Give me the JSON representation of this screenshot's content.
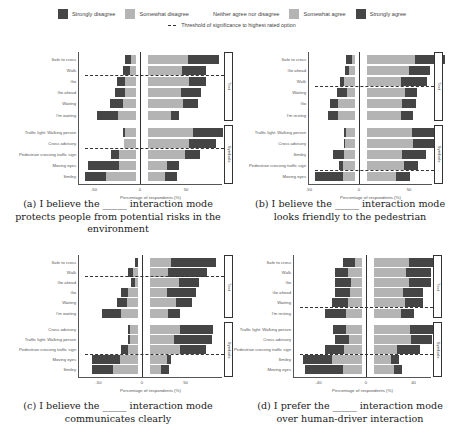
{
  "legend": {
    "items": [
      {
        "label": "Strongly disagree",
        "color": "#454545"
      },
      {
        "label": "Somewhat disagree",
        "color": "#b4b4b4"
      },
      {
        "label": "Neither agree nor disagree",
        "color": "#ffffff"
      },
      {
        "label": "Somewhat agree",
        "color": "#b4b4b4"
      },
      {
        "label": "Strongly agree",
        "color": "#454545"
      }
    ],
    "threshold_label": "Threshold of significance to highest rated option"
  },
  "chart_data": [
    {
      "type": "bar",
      "subtype": "diverging_stacked_likert",
      "caption": "(a) I believe the _____ interaction mode protects people from potential risks in the environment",
      "xlabel": "Percentage of respondents (%)",
      "xticks": [
        -50,
        0,
        50
      ],
      "xlim": [
        -65,
        90
      ],
      "groups": [
        "Text",
        "Symbols"
      ],
      "categories": [
        "Safe to cross",
        "Walk",
        "Go",
        "Go ahead",
        "Waiting",
        "I'm waiting",
        "Traffic light: Walking person",
        "Cross advisory",
        "Pedestrian crossing traffic sign",
        "Moving eyes",
        "Smiley"
      ],
      "category_groups": [
        "Text",
        "Text",
        "Text",
        "Text",
        "Text",
        "Text",
        "Symbols",
        "Symbols",
        "Symbols",
        "Symbols",
        "Symbols"
      ],
      "series": [
        {
          "name": "Strongly disagree",
          "values": [
            7,
            8,
            9,
            11,
            14,
            22,
            2,
            0,
            8,
            33,
            22
          ]
        },
        {
          "name": "Somewhat disagree",
          "values": [
            5,
            6,
            12,
            12,
            14,
            20,
            12,
            13,
            19,
            19,
            33
          ]
        },
        {
          "name": "Somewhat agree",
          "values": [
            44,
            37,
            45,
            36,
            38,
            25,
            49,
            45,
            40,
            21,
            18
          ]
        },
        {
          "name": "Strongly agree",
          "values": [
            33,
            26,
            18,
            22,
            16,
            9,
            32,
            29,
            16,
            13,
            14
          ]
        }
      ],
      "threshold_after_index": [
        1,
        7
      ]
    },
    {
      "type": "bar",
      "subtype": "diverging_stacked_likert",
      "caption": "(b) I believe the _____ interaction mode looks friendly to the pedestrian",
      "xlabel": "Percentage of respondents (%)",
      "xticks": [
        -50,
        0,
        50
      ],
      "xlim": [
        -55,
        95
      ],
      "groups": [
        "Text",
        "Symbols"
      ],
      "categories": [
        "Safe to cross",
        "Go ahead",
        "Walk",
        "Waiting",
        "Go",
        "I'm resting",
        "Traffic light: Walking person",
        "Cross advisory",
        "Smiley",
        "Pedestrian crossing traffic sign",
        "Moving eyes"
      ],
      "category_groups": [
        "Text",
        "Text",
        "Text",
        "Text",
        "Text",
        "Text",
        "Symbols",
        "Symbols",
        "Symbols",
        "Symbols",
        "Symbols"
      ],
      "series": [
        {
          "name": "Strongly disagree",
          "values": [
            6,
            4,
            4,
            10,
            8,
            10,
            2,
            1,
            11,
            4,
            28
          ]
        },
        {
          "name": "Somewhat disagree",
          "values": [
            3,
            6,
            11,
            8,
            17,
            17,
            9,
            10,
            11,
            12,
            12
          ]
        },
        {
          "name": "Somewhat agree",
          "values": [
            48,
            42,
            34,
            38,
            35,
            34,
            45,
            46,
            35,
            37,
            29
          ]
        },
        {
          "name": "Strongly agree",
          "values": [
            30,
            21,
            26,
            12,
            14,
            12,
            24,
            22,
            24,
            14,
            14
          ]
        }
      ],
      "threshold_after_index": [
        2,
        9
      ]
    },
    {
      "type": "bar",
      "subtype": "diverging_stacked_likert",
      "caption": "(c) I believe the _____ interaction mode communicates clearly",
      "xlabel": "Percentage of respondents (%)",
      "xticks": [
        -50,
        0,
        50
      ],
      "xlim": [
        -65,
        90
      ],
      "groups": [
        "Text",
        "Symbols"
      ],
      "categories": [
        "Safe to cross",
        "Walk",
        "Go ahead",
        "Go",
        "Waiting",
        "I'm waiting",
        "Cross advisory",
        "Traffic light: Walking person",
        "Pedestrian crossing traffic sign",
        "Moving eyes",
        "Smiley"
      ],
      "category_groups": [
        "Text",
        "Text",
        "Text",
        "Text",
        "Text",
        "Text",
        "Symbols",
        "Symbols",
        "Symbols",
        "Symbols",
        "Symbols"
      ],
      "series": [
        {
          "name": "Strongly disagree",
          "values": [
            3,
            5,
            5,
            8,
            11,
            21,
            2,
            3,
            7,
            32,
            24
          ]
        },
        {
          "name": "Somewhat disagree",
          "values": [
            0,
            6,
            3,
            12,
            13,
            20,
            9,
            9,
            12,
            21,
            29
          ]
        },
        {
          "name": "Somewhat agree",
          "values": [
            24,
            21,
            33,
            19,
            30,
            21,
            35,
            28,
            34,
            19,
            13
          ]
        },
        {
          "name": "Strongly agree",
          "values": [
            52,
            44,
            23,
            34,
            18,
            14,
            37,
            43,
            30,
            5,
            9
          ]
        }
      ],
      "threshold_after_index": [
        1,
        8
      ]
    },
    {
      "type": "bar",
      "subtype": "diverging_stacked_likert",
      "caption": "(d) I prefer the _____ interaction mode over human-driver interaction",
      "xlabel": "Percentage of respondents (%)",
      "xticks": [
        -40,
        0,
        40
      ],
      "xlim": [
        -75,
        75
      ],
      "groups": [
        "Text",
        "Symbols"
      ],
      "categories": [
        "Safe to cross",
        "Walk",
        "Go",
        "Go ahead",
        "Waiting",
        "I'm resting",
        "Traffic light: Walking person",
        "Cross advisory",
        "Pedestrian crossing traffic sign",
        "Smiley",
        "Moving eyes"
      ],
      "category_groups": [
        "Text",
        "Text",
        "Text",
        "Text",
        "Text",
        "Text",
        "Symbols",
        "Symbols",
        "Symbols",
        "Symbols",
        "Symbols"
      ],
      "series": [
        {
          "name": "Strongly disagree",
          "values": [
            13,
            13,
            16,
            15,
            17,
            22,
            14,
            14,
            20,
            30,
            40
          ]
        },
        {
          "name": "Somewhat disagree",
          "values": [
            7,
            15,
            12,
            13,
            15,
            17,
            17,
            14,
            19,
            32,
            20
          ]
        },
        {
          "name": "Somewhat agree",
          "values": [
            37,
            34,
            37,
            31,
            33,
            28,
            38,
            39,
            24,
            18,
            21
          ]
        },
        {
          "name": "Strongly agree",
          "values": [
            33,
            26,
            23,
            21,
            19,
            14,
            26,
            22,
            24,
            8,
            8
          ]
        }
      ],
      "threshold_after_index": [
        4,
        8
      ]
    }
  ]
}
